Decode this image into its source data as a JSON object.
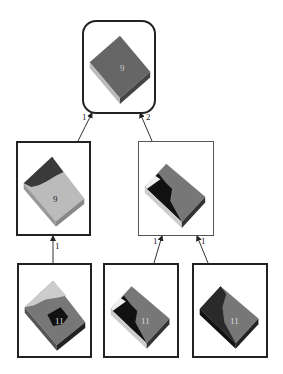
{
  "diagram": {
    "type": "tree",
    "nodes": [
      {
        "id": "root",
        "label": "9",
        "level": 0
      },
      {
        "id": "left-mid",
        "label": "9",
        "level": 1
      },
      {
        "id": "right-mid",
        "label": "",
        "level": 1
      },
      {
        "id": "bottom-left",
        "label": "11",
        "level": 2
      },
      {
        "id": "bottom-center",
        "label": "11",
        "level": 2
      },
      {
        "id": "bottom-right",
        "label": "11",
        "level": 2
      }
    ],
    "edges": [
      {
        "from": "left-mid",
        "to": "root",
        "label": "1"
      },
      {
        "from": "right-mid",
        "to": "root",
        "label": "2"
      },
      {
        "from": "bottom-left",
        "to": "left-mid",
        "label": "1"
      },
      {
        "from": "bottom-center",
        "to": "right-mid",
        "label": "1"
      },
      {
        "from": "bottom-right",
        "to": "right-mid",
        "label": "1"
      }
    ]
  }
}
